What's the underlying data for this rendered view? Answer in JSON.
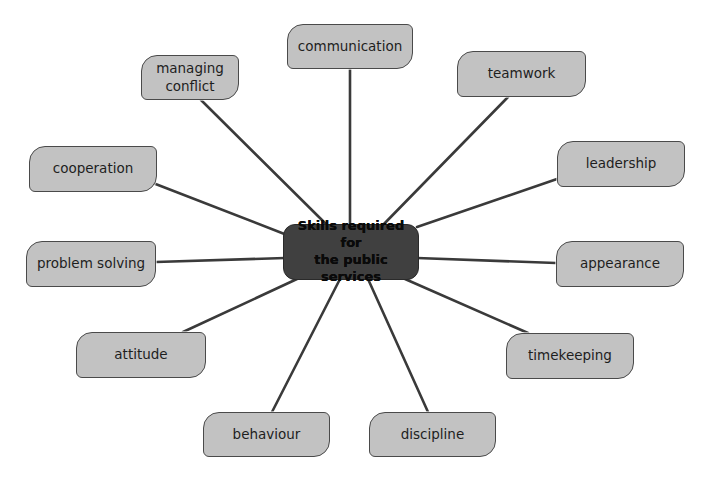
{
  "diagram": {
    "type": "mind-map",
    "center": {
      "line1": "Skills required for",
      "line2": "the public services"
    },
    "nodes": [
      {
        "id": "communication",
        "label": "communication"
      },
      {
        "id": "managing-conflict",
        "label_line1": "managing",
        "label_line2": "conflict"
      },
      {
        "id": "teamwork",
        "label": "teamwork"
      },
      {
        "id": "cooperation",
        "label": "cooperation"
      },
      {
        "id": "leadership",
        "label": "leadership"
      },
      {
        "id": "problem-solving",
        "label": "problem solving"
      },
      {
        "id": "appearance",
        "label": "appearance"
      },
      {
        "id": "attitude",
        "label": "attitude"
      },
      {
        "id": "timekeeping",
        "label": "timekeeping"
      },
      {
        "id": "behaviour",
        "label": "behaviour"
      },
      {
        "id": "discipline",
        "label": "discipline"
      }
    ],
    "colors": {
      "node_fill": "#c2c2c2",
      "center_fill": "#404040",
      "line": "#3a3a3a"
    }
  }
}
